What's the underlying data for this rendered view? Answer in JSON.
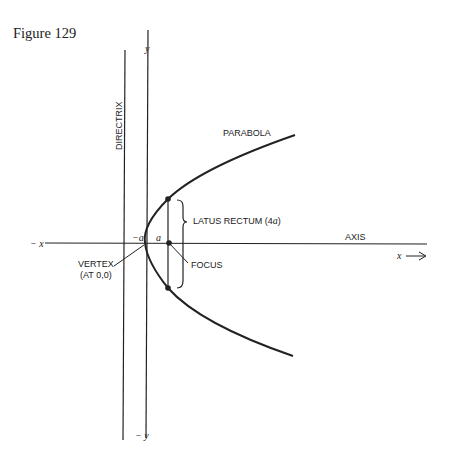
{
  "figure": {
    "title": "Figure 129"
  },
  "labels": {
    "directrix": "DIRECTRIX",
    "y_top": "y",
    "y_bottom": "− y",
    "x_left": "− x",
    "x_right": "x",
    "axis": "AXIS",
    "parabola": "PARABOLA",
    "latus_rectum": "LATUS RECTUM (4",
    "latus_rectum_a": "a",
    "latus_rectum_close": ")",
    "minus_a": "−a",
    "a": "a",
    "focus": "FOCUS",
    "vertex_line1": "VERTEX",
    "vertex_line2": "(AT 0,0)"
  },
  "colors": {
    "ink": "#222222",
    "background": "#ffffff"
  }
}
